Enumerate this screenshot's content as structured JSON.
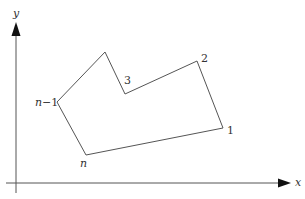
{
  "diagram": {
    "title": "",
    "axes": {
      "x_label": "x",
      "y_label": "y",
      "color": "#555555",
      "arrow_color": "#111111"
    },
    "polygon": {
      "stroke": "#555555",
      "vertices": [
        {
          "id": "1",
          "label": "1",
          "x": 223,
          "y": 128
        },
        {
          "id": "2",
          "label": "2",
          "x": 197,
          "y": 61
        },
        {
          "id": "3",
          "label": "3",
          "x": 125,
          "y": 94
        },
        {
          "id": "top",
          "label": "",
          "x": 105,
          "y": 52
        },
        {
          "id": "n-1",
          "label": "n−1",
          "x": 57,
          "y": 102
        },
        {
          "id": "n",
          "label": "n",
          "x": 86,
          "y": 155
        }
      ]
    },
    "labels": {
      "v1": "1",
      "v2": "2",
      "v3": "3",
      "vn_minus_1_n": "n",
      "vn_minus_1_rest": "−1",
      "vn": "n"
    }
  }
}
